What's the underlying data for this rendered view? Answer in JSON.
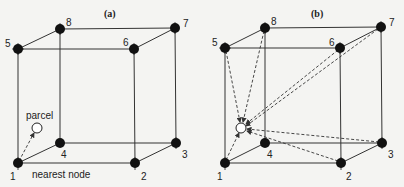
{
  "panels": [
    {
      "title": "(a)",
      "node_labels": [
        "1",
        "2",
        "3",
        "4",
        "5",
        "6",
        "7",
        "8"
      ],
      "parcel_label": "parcel",
      "nearest_label": "nearest node",
      "description": "Parcel connected to nearest node (node 1) only"
    },
    {
      "title": "(b)",
      "node_labels": [
        "1",
        "2",
        "3",
        "4",
        "5",
        "6",
        "7",
        "8"
      ],
      "description": "Parcel connected to all eight cube nodes"
    }
  ],
  "colors": {
    "background": "#f4f4f2",
    "node": "#111111",
    "edge": "#333333",
    "parcel_fill": "#ffffff"
  }
}
